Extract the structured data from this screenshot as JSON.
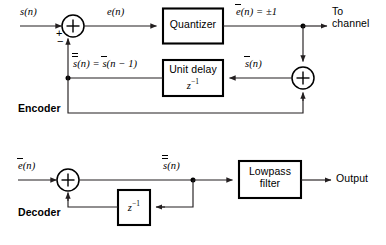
{
  "figure": {
    "caption": ""
  },
  "colors": {
    "ink": "#000000",
    "wire": "#231f20",
    "background": "#ffffff"
  },
  "encoder": {
    "section_label": "Encoder",
    "input_label": "s(n)",
    "summer1": {
      "symbol": "+",
      "sign_left": "+",
      "sign_bottom": "−"
    },
    "error_label": "e(n)",
    "quantizer_label": "Quantizer",
    "quantized_label": "e(n) = ±1",
    "quantized_label_base": "e",
    "quantized_label_rest": "(n) = ±1",
    "channel_label_line1": "To",
    "channel_label_line2": "channel",
    "summer2": {
      "symbol": "+"
    },
    "feedback_label": "s(n) = s(n − 1)",
    "feedback_label_left_base": "s",
    "feedback_label_mid": "(n) = ",
    "feedback_label_right_base": "s",
    "feedback_label_tail": "(n − 1)",
    "unit_delay_line1": "Unit delay",
    "unit_delay_line2": "z",
    "unit_delay_exponent": "−1",
    "predictor_label_base": "s",
    "predictor_label_rest": "(n)"
  },
  "decoder": {
    "section_label": "Decoder",
    "input_label_base": "e",
    "input_label_rest": "(n)",
    "summer": {
      "symbol": "+"
    },
    "recon_label_base": "s",
    "recon_label_rest": "(n)",
    "delay_label": "z",
    "delay_exponent": "−1",
    "lowpass_line1": "Lowpass",
    "lowpass_line2": "filter",
    "output_label": "Output"
  }
}
